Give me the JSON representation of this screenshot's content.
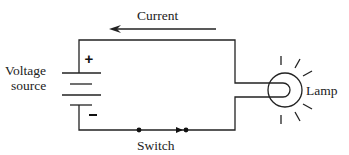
{
  "diagram": {
    "type": "circuit",
    "labels": {
      "current": "Current",
      "voltage_line1": "Voltage",
      "voltage_line2": "source",
      "plus": "+",
      "minus": "-",
      "switch": "Switch",
      "lamp": "Lamp"
    },
    "components": [
      "voltage-source",
      "switch",
      "lamp"
    ],
    "current_direction": "counterclockwise (right-to-left along top wire)",
    "colors": {
      "line": "#222222",
      "background": "#ffffff"
    }
  }
}
